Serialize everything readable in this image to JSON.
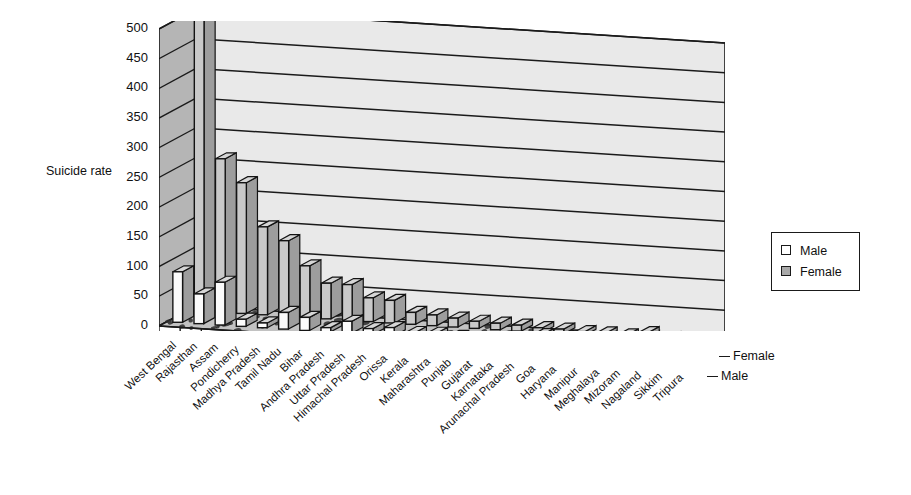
{
  "chart_data": {
    "type": "bar",
    "title": "",
    "subtitle": "",
    "xlabel": "",
    "ylabel": "Suicide rate",
    "ylim": [
      0,
      500
    ],
    "ytick_step": 50,
    "yticks": [
      0,
      50,
      100,
      150,
      200,
      250,
      300,
      350,
      400,
      450,
      500
    ],
    "grid": true,
    "three_d": true,
    "legend_position": "right",
    "depth_axis_labels": [
      "Male",
      "Female"
    ],
    "categories": [
      "West Bengal",
      "Rajasthan",
      "Assam",
      "Pondicherry",
      "Madhya Pradesh",
      "Tamil Nadu",
      "Bihar",
      "Andhra Pradesh",
      "Uttar Pradesh",
      "Himachal Pradesh",
      "Orissa",
      "Kerala",
      "Maharashtra",
      "Punjab",
      "Gujarat",
      "Karnataka",
      "Arunachal Pradesh",
      "Goa",
      "Haryana",
      "Manipur",
      "Meghalaya",
      "Mizoram",
      "Nagaland",
      "Sikkim",
      "Tripura"
    ],
    "series": [
      {
        "name": "Male",
        "color": "#fbfbfb",
        "values": [
          85,
          50,
          72,
          12,
          8,
          28,
          22,
          7,
          20,
          10,
          14,
          8,
          9,
          6,
          5,
          6,
          4,
          18,
          3,
          4,
          3,
          5,
          33,
          3,
          2
        ]
      },
      {
        "name": "Female",
        "color": "#c9c9c9",
        "values": [
          490,
          258,
          220,
          148,
          127,
          87,
          60,
          60,
          40,
          38,
          20,
          18,
          15,
          12,
          11,
          10,
          8,
          8,
          6,
          6,
          5,
          5,
          5,
          4,
          3
        ]
      }
    ]
  },
  "legend": {
    "entries": [
      {
        "label": "Male",
        "swatch": "#ffffff"
      },
      {
        "label": "Female",
        "swatch": "#a9a9a9"
      }
    ]
  },
  "axis": {
    "y_title": "Suicide rate",
    "depth_label_back": "Female",
    "depth_label_front": "Male"
  }
}
